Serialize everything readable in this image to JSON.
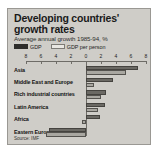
{
  "chart_data": {
    "type": "bar",
    "orientation": "horizontal",
    "title": "Developing countries' growth rates",
    "subtitle": "Average annual growth 1985-94, %",
    "xlabel": "",
    "ylabel": "",
    "xlim": [
      -8,
      8
    ],
    "xticks": [
      -8,
      -6,
      -4,
      -2,
      0,
      2,
      4,
      6,
      8
    ],
    "xticklabels": [
      "8",
      "6",
      "4",
      "2",
      "0",
      "2",
      "4",
      "6",
      "8"
    ],
    "grid": false,
    "legend_position": "top-left",
    "categories": [
      "Asia",
      "Middle East and Europe",
      "Rich industrial countries",
      "Latin America",
      "Africa",
      "Eastern Europe"
    ],
    "series": [
      {
        "name": "GDP",
        "color": "#6b6964",
        "values": [
          6.9,
          3.6,
          2.6,
          2.5,
          1.9,
          -4.9
        ]
      },
      {
        "name": "GDP per person",
        "color": "#a9a7a1",
        "values": [
          5.3,
          1.1,
          2.0,
          1.6,
          -0.5,
          -5.4
        ]
      }
    ],
    "source": "Source: IMF"
  },
  "legend": {
    "items": [
      {
        "label": "GDP",
        "swatch": "dark"
      },
      {
        "label": "GDP per person",
        "swatch": "light"
      }
    ]
  }
}
